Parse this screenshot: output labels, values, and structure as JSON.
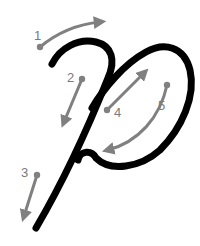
{
  "diagram": {
    "letter": "p",
    "colors": {
      "letter_stroke": "#000000",
      "arrows": "#808080",
      "labels": "#7a7a7a",
      "background": "#ffffff"
    },
    "steps": [
      {
        "number": "1",
        "direction": "up-right curve"
      },
      {
        "number": "2",
        "direction": "down-left"
      },
      {
        "number": "3",
        "direction": "down-left"
      },
      {
        "number": "4",
        "direction": "up-right"
      },
      {
        "number": "5",
        "direction": "down-left curve"
      }
    ]
  }
}
